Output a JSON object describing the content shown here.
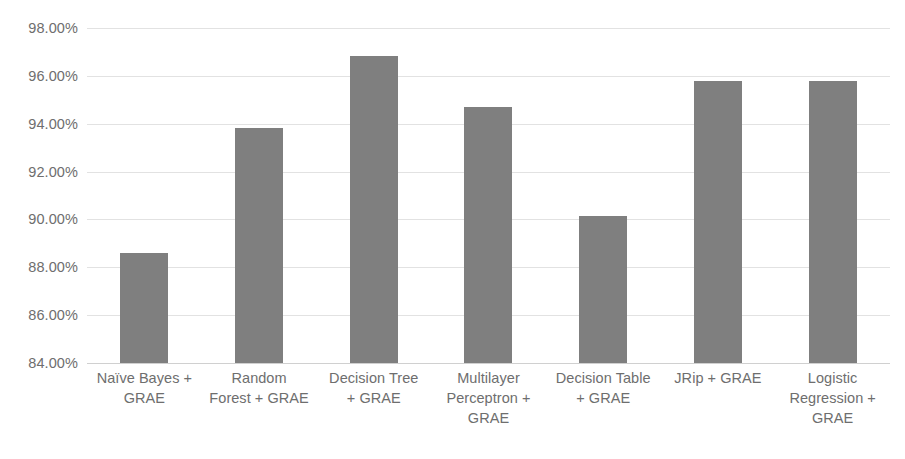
{
  "chart_data": {
    "type": "bar",
    "title": "",
    "subtitle": "",
    "xlabel": "",
    "ylabel": "",
    "ylim": [
      84,
      98
    ],
    "grid": true,
    "legend": false,
    "legend_position": "none",
    "bar_color": "#7f7f7f",
    "gridline_color": "#e2e2e2",
    "tick_label_color": "#6e6e6e",
    "y_tick_labels": [
      "98.00%",
      "96.00%",
      "94.00%",
      "92.00%",
      "90.00%",
      "88.00%",
      "86.00%",
      "84.00%"
    ],
    "y_tick_values": [
      98,
      96,
      94,
      92,
      90,
      88,
      86,
      84
    ],
    "categories": [
      "Naïve Bayes + GRAE",
      "Random Forest + GRAE",
      "Decision Tree + GRAE",
      "Multilayer Perceptron + GRAE",
      "Decision Table + GRAE",
      "JRip + GRAE",
      "Logistic Regression + GRAE"
    ],
    "category_lines": [
      [
        "Naïve Bayes +",
        "GRAE"
      ],
      [
        "Random",
        "Forest + GRAE"
      ],
      [
        "Decision Tree",
        "+ GRAE"
      ],
      [
        "Multilayer",
        "Perceptron +",
        "GRAE"
      ],
      [
        "Decision Table",
        "+ GRAE"
      ],
      [
        "JRip + GRAE"
      ],
      [
        "Logistic",
        "Regression +",
        "GRAE"
      ]
    ],
    "values": [
      88.6,
      93.83,
      96.83,
      94.7,
      90.13,
      95.8,
      95.78
    ]
  }
}
